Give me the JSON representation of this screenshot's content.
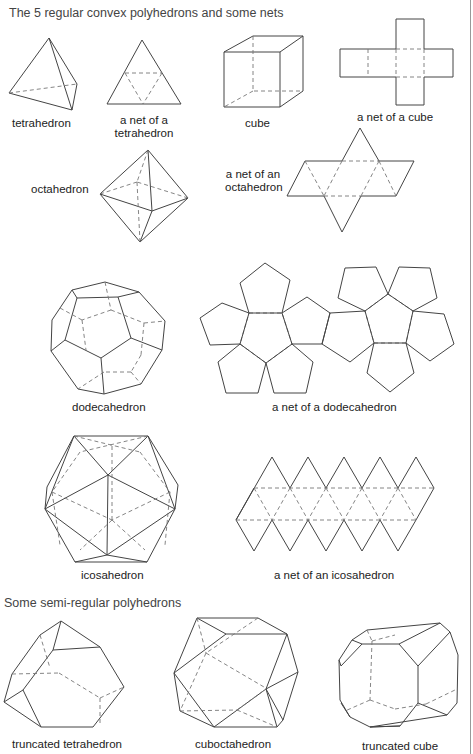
{
  "sections": {
    "regular_title": "The 5 regular convex polyhedrons and some nets",
    "semi_title": "Some semi-regular polyhedrons"
  },
  "labels": {
    "tetrahedron": "tetrahedron",
    "tetra_net_1": "a net of a",
    "tetra_net_2": "tetrahedron",
    "cube": "cube",
    "cube_net": "a net of a cube",
    "octahedron": "octahedron",
    "octa_net_1": "a net of an",
    "octa_net_2": "octahedron",
    "dodecahedron": "dodecahedron",
    "dodeca_net": "a net of a dodecahedron",
    "icosahedron": "icosahedron",
    "icosa_net": "a net of an icosahedron",
    "truncated_tetrahedron": "truncated tetrahedron",
    "cuboctahedron": "cuboctahedron",
    "truncated_cube": "truncated cube"
  }
}
